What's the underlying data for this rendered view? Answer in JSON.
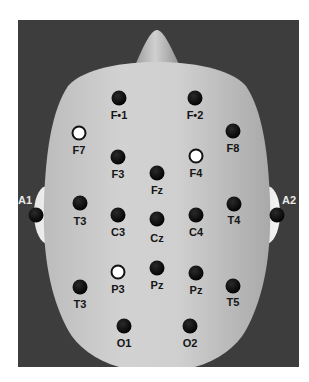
{
  "figure": {
    "type": "eeg-electrode-map-10-20",
    "colors": {
      "background_panel": "#3d3d3d",
      "head": "#c8c8c8",
      "electrode_default": "#0a0a0a",
      "electrode_highlight": "#ffffff"
    }
  },
  "electrodes": [
    {
      "id": "fp1",
      "label": "F•1",
      "x": 119,
      "y": 98,
      "lx": 119,
      "ly": 115,
      "highlight": false
    },
    {
      "id": "fp2",
      "label": "F•2",
      "x": 195,
      "y": 98,
      "lx": 195,
      "ly": 115,
      "highlight": false
    },
    {
      "id": "f7",
      "label": "F7",
      "x": 79,
      "y": 133,
      "lx": 79,
      "ly": 150,
      "highlight": true
    },
    {
      "id": "f8",
      "label": "F8",
      "x": 233,
      "y": 131,
      "lx": 233,
      "ly": 148,
      "highlight": false
    },
    {
      "id": "f3",
      "label": "F3",
      "x": 118,
      "y": 157,
      "lx": 118,
      "ly": 174,
      "highlight": false
    },
    {
      "id": "f4",
      "label": "F4",
      "x": 196,
      "y": 156,
      "lx": 196,
      "ly": 173,
      "highlight": true
    },
    {
      "id": "fz",
      "label": "Fz",
      "x": 157,
      "y": 173,
      "lx": 157,
      "ly": 190,
      "highlight": false
    },
    {
      "id": "a1",
      "label": "A1",
      "x": 36,
      "y": 215,
      "lx": 25,
      "ly": 200,
      "highlight": false,
      "light_label": true
    },
    {
      "id": "a2",
      "label": "A2",
      "x": 277,
      "y": 215,
      "lx": 289,
      "ly": 200,
      "highlight": false,
      "light_label": true
    },
    {
      "id": "t3",
      "label": "T3",
      "x": 80,
      "y": 203,
      "lx": 80,
      "ly": 221,
      "highlight": false
    },
    {
      "id": "c3",
      "label": "C3",
      "x": 118,
      "y": 215,
      "lx": 118,
      "ly": 232,
      "highlight": false
    },
    {
      "id": "cz",
      "label": "Cz",
      "x": 157,
      "y": 219,
      "lx": 157,
      "ly": 238,
      "highlight": false
    },
    {
      "id": "c4",
      "label": "C4",
      "x": 196,
      "y": 215,
      "lx": 196,
      "ly": 232,
      "highlight": false
    },
    {
      "id": "t4",
      "label": "T4",
      "x": 234,
      "y": 204,
      "lx": 234,
      "ly": 220,
      "highlight": false
    },
    {
      "id": "t3-lower",
      "label": "T3",
      "x": 80,
      "y": 287,
      "lx": 80,
      "ly": 304,
      "highlight": false
    },
    {
      "id": "p3",
      "label": "P3",
      "x": 118,
      "y": 272,
      "lx": 118,
      "ly": 289,
      "highlight": true
    },
    {
      "id": "pz",
      "label": "Pz",
      "x": 157,
      "y": 268,
      "lx": 157,
      "ly": 285,
      "highlight": false
    },
    {
      "id": "pz-right",
      "label": "Pz",
      "x": 196,
      "y": 273,
      "lx": 196,
      "ly": 290,
      "highlight": false
    },
    {
      "id": "t5",
      "label": "T5",
      "x": 233,
      "y": 286,
      "lx": 233,
      "ly": 302,
      "highlight": false
    },
    {
      "id": "o1",
      "label": "O1",
      "x": 124,
      "y": 326,
      "lx": 124,
      "ly": 343,
      "highlight": false
    },
    {
      "id": "o2",
      "label": "O2",
      "x": 190,
      "y": 326,
      "lx": 190,
      "ly": 343,
      "highlight": false
    }
  ]
}
